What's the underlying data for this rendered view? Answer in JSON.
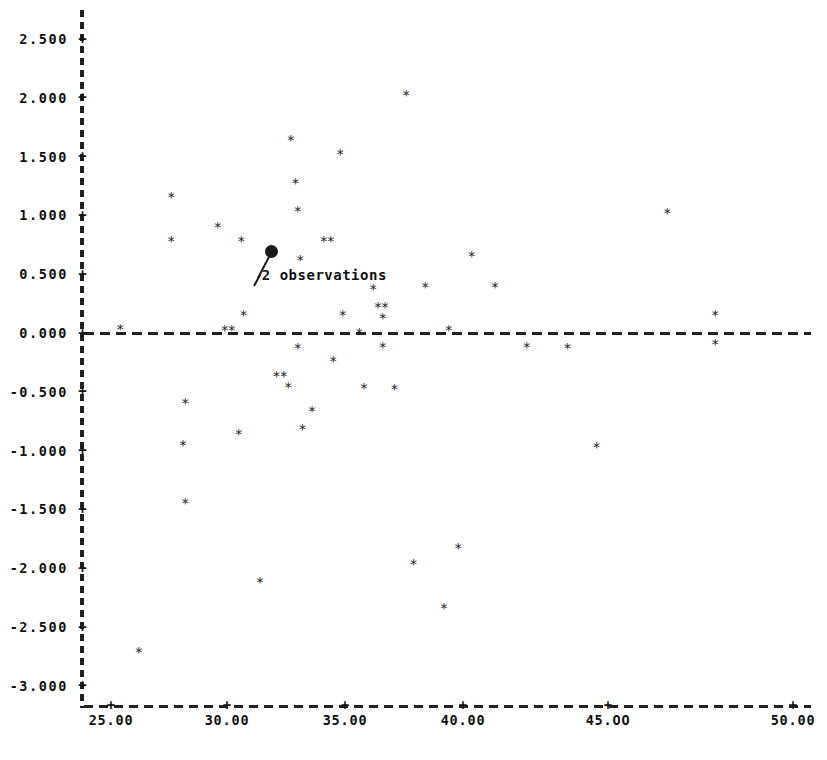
{
  "chart_data": {
    "type": "scatter",
    "title": "",
    "subtitle": "",
    "xlabel": "",
    "ylabel": "",
    "xlim": [
      24.0,
      50.5
    ],
    "ylim": [
      -3.25,
      2.75
    ],
    "grid": false,
    "legend": null,
    "reference_lines": [
      {
        "name": "zero-line",
        "axis": "y",
        "value": 0.0,
        "style": "dashed"
      }
    ],
    "x_ticks": [
      {
        "value": 25.0,
        "label": "25.00"
      },
      {
        "value": 30.0,
        "label": "30.00"
      },
      {
        "value": 35.0,
        "label": "35.00"
      },
      {
        "value": 40.0,
        "label": "40.00"
      },
      {
        "value": 45.0,
        "label": "45.OO"
      },
      {
        "value": 50.0,
        "label": "50.00"
      }
    ],
    "y_ticks": [
      {
        "value": 2.5,
        "label": "2.500"
      },
      {
        "value": 2.0,
        "label": "2.000"
      },
      {
        "value": 1.5,
        "label": "1.500"
      },
      {
        "value": 1.0,
        "label": "1.000"
      },
      {
        "value": 0.5,
        "label": "0.500"
      },
      {
        "value": 0.0,
        "label": "0.000"
      },
      {
        "value": -0.5,
        "label": "-0.500"
      },
      {
        "value": -1.0,
        "label": "-1.000"
      },
      {
        "value": -1.5,
        "label": "-1.500"
      },
      {
        "value": -2.0,
        "label": "-2.000"
      },
      {
        "value": -2.5,
        "label": "-2.500"
      },
      {
        "value": -3.0,
        "label": "-3.000"
      }
    ],
    "tick_glyph": "+",
    "marker_glyph": "*",
    "overlap_marker_glyph": "dot",
    "points": [
      {
        "x": 26.2,
        "y": -2.72,
        "count": 1
      },
      {
        "x": 25.4,
        "y": 0.03,
        "count": 1
      },
      {
        "x": 27.6,
        "y": 1.15,
        "count": 1
      },
      {
        "x": 27.6,
        "y": 0.78,
        "count": 1
      },
      {
        "x": 28.2,
        "y": -0.6,
        "count": 1
      },
      {
        "x": 28.1,
        "y": -0.96,
        "count": 1
      },
      {
        "x": 28.2,
        "y": -1.45,
        "count": 1
      },
      {
        "x": 29.6,
        "y": 0.9,
        "count": 1
      },
      {
        "x": 29.9,
        "y": 0.02,
        "count": 1
      },
      {
        "x": 30.2,
        "y": 0.02,
        "count": 1
      },
      {
        "x": 30.6,
        "y": 0.78,
        "count": 1
      },
      {
        "x": 30.7,
        "y": 0.15,
        "count": 1
      },
      {
        "x": 30.5,
        "y": -0.86,
        "count": 1
      },
      {
        "x": 31.4,
        "y": -2.12,
        "count": 1
      },
      {
        "x": 31.9,
        "y": 0.69,
        "count": 2
      },
      {
        "x": 32.1,
        "y": -0.37,
        "count": 1
      },
      {
        "x": 32.4,
        "y": -0.37,
        "count": 1
      },
      {
        "x": 32.6,
        "y": -0.46,
        "count": 1
      },
      {
        "x": 32.7,
        "y": 1.64,
        "count": 1
      },
      {
        "x": 32.9,
        "y": 1.27,
        "count": 1
      },
      {
        "x": 33.0,
        "y": 1.03,
        "count": 1
      },
      {
        "x": 33.1,
        "y": 0.62,
        "count": 1
      },
      {
        "x": 33.0,
        "y": -0.13,
        "count": 1
      },
      {
        "x": 33.2,
        "y": -0.82,
        "count": 1
      },
      {
        "x": 33.6,
        "y": -0.67,
        "count": 1
      },
      {
        "x": 34.1,
        "y": 0.78,
        "count": 1
      },
      {
        "x": 34.4,
        "y": 0.78,
        "count": 1
      },
      {
        "x": 34.5,
        "y": -0.24,
        "count": 1
      },
      {
        "x": 34.8,
        "y": 1.52,
        "count": 1
      },
      {
        "x": 34.9,
        "y": 0.15,
        "count": 1
      },
      {
        "x": 35.6,
        "y": 0.0,
        "count": 1
      },
      {
        "x": 35.8,
        "y": -0.47,
        "count": 1
      },
      {
        "x": 36.2,
        "y": 0.37,
        "count": 1
      },
      {
        "x": 36.4,
        "y": 0.22,
        "count": 1
      },
      {
        "x": 36.7,
        "y": 0.22,
        "count": 1
      },
      {
        "x": 36.6,
        "y": 0.12,
        "count": 1
      },
      {
        "x": 36.6,
        "y": -0.12,
        "count": 1
      },
      {
        "x": 37.1,
        "y": -0.48,
        "count": 1
      },
      {
        "x": 37.6,
        "y": 2.02,
        "count": 1
      },
      {
        "x": 37.9,
        "y": -1.97,
        "count": 1
      },
      {
        "x": 38.4,
        "y": 0.39,
        "count": 1
      },
      {
        "x": 39.4,
        "y": 0.02,
        "count": 1
      },
      {
        "x": 39.2,
        "y": -2.34,
        "count": 1
      },
      {
        "x": 39.8,
        "y": -1.83,
        "count": 1
      },
      {
        "x": 40.3,
        "y": 0.65,
        "count": 1
      },
      {
        "x": 41.1,
        "y": 0.39,
        "count": 1
      },
      {
        "x": 42.2,
        "y": -0.12,
        "count": 1
      },
      {
        "x": 43.6,
        "y": -0.13,
        "count": 1
      },
      {
        "x": 44.6,
        "y": -0.97,
        "count": 1
      },
      {
        "x": 46.6,
        "y": 1.02,
        "count": 1
      },
      {
        "x": 47.9,
        "y": 0.15,
        "count": 1
      },
      {
        "x": 47.9,
        "y": -0.1,
        "count": 1
      }
    ],
    "annotations": [
      {
        "text": "2 observations",
        "points_to": {
          "x": 31.9,
          "y": 0.69
        },
        "leader": true
      }
    ]
  }
}
